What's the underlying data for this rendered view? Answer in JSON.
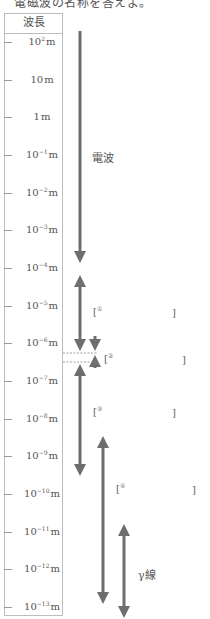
{
  "heading": "電磁波の名称を答えよ。",
  "table": {
    "header": "波長",
    "ticks": [
      {
        "base": "10",
        "exp": "2",
        "unit": "m",
        "y": 42
      },
      {
        "base": "10",
        "exp": "",
        "unit": "m",
        "y": 80
      },
      {
        "base": "1",
        "exp": "",
        "unit": "m",
        "y": 117
      },
      {
        "base": "10",
        "exp": "−1",
        "unit": "m",
        "y": 155
      },
      {
        "base": "10",
        "exp": "−2",
        "unit": "m",
        "y": 193
      },
      {
        "base": "10",
        "exp": "−3",
        "unit": "m",
        "y": 230
      },
      {
        "base": "10",
        "exp": "−4",
        "unit": "m",
        "y": 268
      },
      {
        "base": "10",
        "exp": "−5",
        "unit": "m",
        "y": 306
      },
      {
        "base": "10",
        "exp": "−6",
        "unit": "m",
        "y": 343
      },
      {
        "base": "10",
        "exp": "−7",
        "unit": "m",
        "y": 381
      },
      {
        "base": "10",
        "exp": "−8",
        "unit": "m",
        "y": 419
      },
      {
        "base": "10",
        "exp": "−9",
        "unit": "m",
        "y": 456
      },
      {
        "base": "10",
        "exp": "−10",
        "unit": "m",
        "y": 494
      },
      {
        "base": "10",
        "exp": "−11",
        "unit": "m",
        "y": 532
      },
      {
        "base": "10",
        "exp": "−12",
        "unit": "m",
        "y": 569
      },
      {
        "base": "10",
        "exp": "−13",
        "unit": "m",
        "y": 607
      }
    ]
  },
  "labels": {
    "radio": "電波",
    "gamma": "γ線"
  },
  "blanks": [
    {
      "num": "①",
      "open": "[",
      "close": "]"
    },
    {
      "num": "②",
      "open": "[",
      "close": "]"
    },
    {
      "num": "③",
      "open": "[",
      "close": "]"
    },
    {
      "num": "④",
      "open": "[",
      "close": "]"
    }
  ],
  "colors": {
    "arrow": "#6e6e6e",
    "border": "#bdbdbd",
    "text": "#555555"
  }
}
